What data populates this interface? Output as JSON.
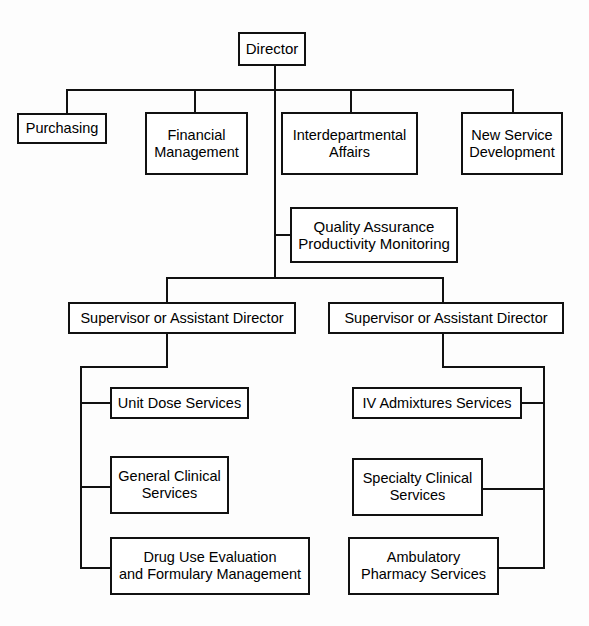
{
  "chart_title": "Pharmacy Department Organizational Chart",
  "chart_type": "organizational-hierarchy-diagram",
  "style": {
    "box_border_color": "#111111",
    "box_fill_color": "#ffffff",
    "line_color": "#111111",
    "background_color": "#ffffff",
    "text_color": "#000000"
  },
  "nodes": {
    "director": {
      "label": "Director",
      "level": 1
    },
    "staff": [
      {
        "label": "Purchasing",
        "level": 2
      },
      {
        "label": "Financial\nManagement",
        "level": 2
      },
      {
        "label": "Interdepartmental\nAffairs",
        "level": 2
      },
      {
        "label": "New Service\nDevelopment",
        "level": 2
      }
    ],
    "quality": {
      "label": "Quality Assurance\nProductivity Monitoring",
      "level": 3
    },
    "supervisors": [
      {
        "label": "Supervisor or Assistant Director",
        "level": 4
      },
      {
        "label": "Supervisor or Assistant Director",
        "level": 4
      }
    ],
    "left_services": [
      {
        "label": "Unit Dose Services",
        "level": 5
      },
      {
        "label": "General Clinical\nServices",
        "level": 5
      },
      {
        "label": "Drug Use Evaluation\nand Formulary Management",
        "level": 5
      }
    ],
    "right_services": [
      {
        "label": "IV Admixtures Services",
        "level": 5
      },
      {
        "label": "Specialty Clinical\nServices",
        "level": 5
      },
      {
        "label": "Ambulatory\nPharmacy Services",
        "level": 5
      }
    ]
  }
}
